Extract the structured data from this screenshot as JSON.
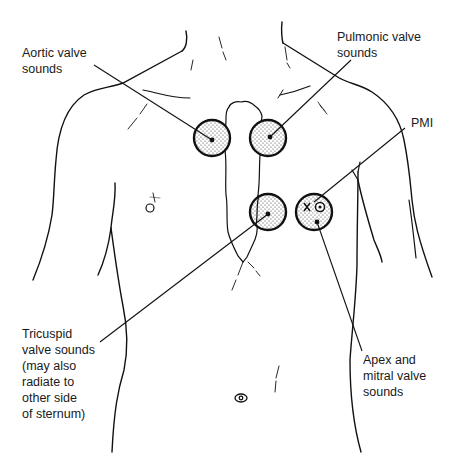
{
  "diagram": {
    "colors": {
      "stroke": "#111111",
      "dot_fill": "#d8d8d8",
      "background": "#ffffff"
    },
    "labels": {
      "aortic": {
        "lines": [
          "Aortic valve",
          "sounds"
        ]
      },
      "pulmonic": {
        "lines": [
          "Pulmonic valve",
          "sounds"
        ]
      },
      "pmi": {
        "lines": [
          "PMI"
        ]
      },
      "tricuspid": {
        "lines": [
          "Tricuspid",
          "valve sounds",
          "(may also",
          "radiate to",
          "other side",
          "of sternum)"
        ]
      },
      "mitral": {
        "lines": [
          "Apex and",
          "mitral valve",
          "sounds"
        ]
      }
    },
    "sites": [
      {
        "name": "aortic",
        "cx": 212,
        "cy": 138,
        "r": 18
      },
      {
        "name": "pulmonic",
        "cx": 268,
        "cy": 138,
        "r": 18
      },
      {
        "name": "tricuspid",
        "cx": 268,
        "cy": 212,
        "r": 18
      },
      {
        "name": "mitral",
        "cx": 314,
        "cy": 212,
        "r": 18
      }
    ],
    "pmi_markers": [
      "×",
      "◎"
    ]
  }
}
